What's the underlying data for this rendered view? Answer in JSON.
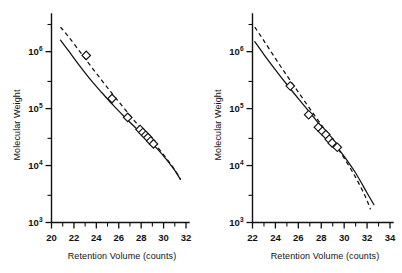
{
  "figure": {
    "panels": [
      "left",
      "right"
    ],
    "background": "#ffffff",
    "ink": "#111111"
  },
  "chart_data": [
    {
      "type": "scatter",
      "panel": "left",
      "title": "",
      "xlabel": "Retention Volume (counts)",
      "ylabel": "Molecular Weight",
      "xlim": [
        20,
        32
      ],
      "ylim": [
        1000,
        3000000
      ],
      "yscale": "log",
      "xticks": [
        20,
        22,
        24,
        26,
        28,
        30,
        32
      ],
      "xtick_labels": [
        "20",
        "22",
        "24",
        "26",
        "28",
        "30",
        "32"
      ],
      "xminor_ticks": [
        21,
        23,
        25,
        27,
        29,
        31
      ],
      "yticks": [
        1000,
        10000,
        100000,
        1000000
      ],
      "ytick_labels": [
        "10³",
        "10⁴",
        "10⁵",
        "10⁶"
      ],
      "ytick_mantissa": [
        "10",
        "10",
        "10",
        "10"
      ],
      "ytick_exponents": [
        "3",
        "4",
        "5",
        "6"
      ],
      "yminor_ticks": [
        3000,
        30000,
        300000,
        3000000
      ],
      "grid": false,
      "legend": false,
      "points": [
        {
          "x": 23.1,
          "y": 860000
        },
        {
          "x": 25.4,
          "y": 150000
        },
        {
          "x": 26.8,
          "y": 70000
        },
        {
          "x": 27.9,
          "y": 43000
        },
        {
          "x": 28.15,
          "y": 38000
        },
        {
          "x": 28.4,
          "y": 34000
        },
        {
          "x": 28.6,
          "y": 31000
        },
        {
          "x": 28.85,
          "y": 27000
        },
        {
          "x": 29.1,
          "y": 24000
        }
      ],
      "series": [
        {
          "name": "solid-calibration-curve",
          "style": "solid",
          "x": [
            20.8,
            21.5,
            22.5,
            23.5,
            24.5,
            25.5,
            26.5,
            27.5,
            28.5,
            29.5,
            30.3,
            31.0,
            31.5
          ],
          "y": [
            1600000,
            1050000,
            570000,
            320000,
            190000,
            115000,
            72000,
            46000,
            30000,
            19000,
            12500,
            8200,
            5700
          ]
        },
        {
          "name": "dashed-calibration-curve",
          "style": "dashed",
          "x": [
            20.8,
            21.5,
            22.5,
            23.5,
            24.5,
            25.5,
            26.5,
            27.5,
            28.5,
            29.5,
            30.3,
            31.0,
            31.5
          ],
          "y": [
            2700000,
            1850000,
            1020000,
            560000,
            310000,
            175000,
            100000,
            58000,
            34000,
            20500,
            13000,
            8400,
            5800
          ]
        }
      ]
    },
    {
      "type": "scatter",
      "panel": "right",
      "title": "",
      "xlabel": "Retention Volume (counts)",
      "ylabel": "Molecular Weight",
      "xlim": [
        22,
        34
      ],
      "ylim": [
        1000,
        3000000
      ],
      "yscale": "log",
      "xticks": [
        22,
        24,
        26,
        28,
        30,
        32,
        34
      ],
      "xtick_labels": [
        "22",
        "24",
        "26",
        "28",
        "30",
        "32",
        "34"
      ],
      "xminor_ticks": [
        23,
        25,
        27,
        29,
        31,
        33
      ],
      "yticks": [
        1000,
        10000,
        100000,
        1000000
      ],
      "ytick_labels": [
        "10³",
        "10⁴",
        "10⁵",
        "10⁶"
      ],
      "ytick_mantissa": [
        "10",
        "10",
        "10",
        "10"
      ],
      "ytick_exponents": [
        "3",
        "4",
        "5",
        "6"
      ],
      "yminor_ticks": [
        3000,
        30000,
        300000,
        3000000
      ],
      "grid": false,
      "legend": false,
      "points": [
        {
          "x": 25.3,
          "y": 250000
        },
        {
          "x": 26.9,
          "y": 78000
        },
        {
          "x": 27.75,
          "y": 47000
        },
        {
          "x": 28.1,
          "y": 40000
        },
        {
          "x": 28.4,
          "y": 35000
        },
        {
          "x": 28.7,
          "y": 29000
        },
        {
          "x": 28.95,
          "y": 25000
        },
        {
          "x": 29.4,
          "y": 21000
        }
      ],
      "series": [
        {
          "name": "solid-calibration-curve",
          "style": "solid",
          "x": [
            22.2,
            23.0,
            24.0,
            25.0,
            26.0,
            27.0,
            28.0,
            29.0,
            30.0,
            31.0,
            32.0,
            32.6
          ],
          "y": [
            1500000,
            890000,
            480000,
            265000,
            150000,
            86000,
            48000,
            26500,
            14500,
            7400,
            3300,
            2050
          ]
        },
        {
          "name": "dashed-calibration-curve",
          "style": "dashed",
          "x": [
            22.2,
            23.0,
            24.0,
            25.0,
            26.0,
            27.0,
            28.0,
            29.0,
            30.0,
            31.0,
            31.8,
            32.3
          ],
          "y": [
            2700000,
            1550000,
            760000,
            380000,
            195000,
            100000,
            52000,
            27000,
            13500,
            6200,
            3000,
            1700
          ]
        }
      ]
    }
  ]
}
